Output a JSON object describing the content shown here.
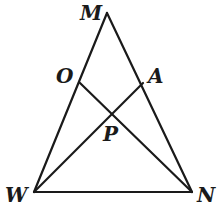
{
  "diagram": {
    "type": "geometry",
    "points": {
      "M": {
        "label": "M",
        "x": 107,
        "y": 13
      },
      "W": {
        "label": "W",
        "x": 34,
        "y": 192
      },
      "N": {
        "label": "N",
        "x": 192,
        "y": 192
      },
      "O": {
        "label": "O",
        "x": 80,
        "y": 83
      },
      "A": {
        "label": "A",
        "x": 143,
        "y": 83
      },
      "P": {
        "label": "P",
        "x": 111,
        "y": 113
      }
    },
    "segments": [
      [
        "M",
        "W"
      ],
      [
        "M",
        "N"
      ],
      [
        "W",
        "N"
      ],
      [
        "O",
        "N"
      ],
      [
        "A",
        "W"
      ]
    ],
    "labels": {
      "M": "M",
      "O": "O",
      "A": "A",
      "P": "P",
      "W": "W",
      "N": "N"
    },
    "stroke_color": "#1a1a1a"
  }
}
